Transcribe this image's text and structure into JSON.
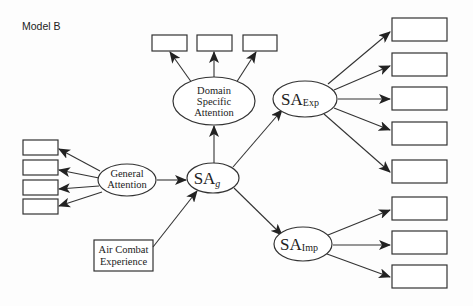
{
  "title": "Model B",
  "nodes": {
    "domain_specific_attention": {
      "lines": [
        "Domain",
        "Specific",
        "Attention"
      ]
    },
    "general_attention": {
      "lines": [
        "General",
        "Attention"
      ]
    },
    "sa_g": {
      "main": "SA",
      "sub": "g"
    },
    "sa_exp": {
      "main": "SA",
      "sub": "Exp"
    },
    "sa_imp": {
      "main": "SA",
      "sub": "Imp"
    },
    "air_combat_experience": {
      "lines": [
        "Air Combat",
        "Experience"
      ]
    }
  },
  "indicators": {
    "domain_specific_attention_count": 3,
    "general_attention_count": 4,
    "sa_exp_count": 5,
    "sa_imp_count": 3
  },
  "colors": {
    "stroke": "#333333",
    "text": "#222222",
    "background": "#fdfdfd"
  }
}
